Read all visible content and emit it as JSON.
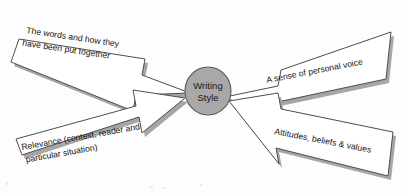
{
  "diagram": {
    "type": "spider-map",
    "hub": {
      "label_line1": "Writing",
      "label_line2": "Style",
      "fill_color": "#a8a8a8",
      "stroke_color": "#5a5a5a"
    },
    "branches": [
      {
        "id": "top-left",
        "position": "top-left",
        "direction": "points-right-down",
        "lines": [
          "The words and how they",
          "have been put together"
        ]
      },
      {
        "id": "top-right",
        "position": "top-right",
        "direction": "points-left-down",
        "lines": [
          "A sense of personal voice"
        ]
      },
      {
        "id": "bottom-left",
        "position": "bottom-left",
        "direction": "points-right-up",
        "lines": [
          "Relevance (context, reader and",
          "particular situation)"
        ]
      },
      {
        "id": "bottom-right",
        "position": "bottom-right",
        "direction": "points-left-up",
        "lines": [
          "Attitudes, beliefs & values"
        ]
      }
    ],
    "style": {
      "arrow_fill": "#ffffff",
      "arrow_stroke": "#4d4d4d",
      "shadow_color": "#a6a6a6",
      "background": "#fdfdfd",
      "text_color": "#141414"
    }
  }
}
